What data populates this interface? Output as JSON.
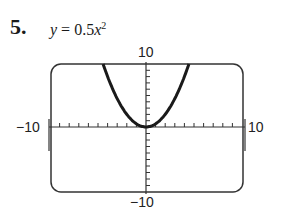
{
  "problem": {
    "number": "5.",
    "equation_lhs": "y",
    "equation_eq": " = 0.5",
    "equation_var": "x",
    "equation_exp": "2"
  },
  "labels": {
    "ymax": "10",
    "ymin": "−10",
    "xmin": "−10",
    "xmax": "10"
  },
  "chart_data": {
    "type": "line",
    "xlabel": "",
    "ylabel": "",
    "xlim": [
      -10,
      10
    ],
    "ylim": [
      -10,
      10
    ],
    "xticks_step": 1,
    "yticks_step": 1,
    "grid": false,
    "series": [
      {
        "name": "y = 0.5x^2",
        "x": [
          -4.47,
          -4,
          -3,
          -2,
          -1,
          0,
          1,
          2,
          3,
          4,
          4.47
        ],
        "y": [
          10,
          8,
          4.5,
          2,
          0.5,
          0,
          0.5,
          2,
          4.5,
          8,
          10
        ]
      }
    ],
    "colors": {
      "curve": "#1a1a1a",
      "frame": "#333333",
      "axes": "#333333"
    }
  }
}
